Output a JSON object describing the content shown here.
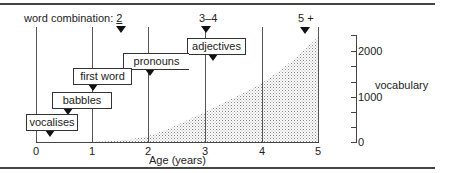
{
  "diagram": {
    "header": {
      "word_combination_label": "word combination: ",
      "word_combination_value": "2",
      "marker_3_4": "3–4",
      "marker_5_plus": "5 +"
    },
    "milestones": [
      {
        "label": "vocalises",
        "age": 0.25
      },
      {
        "label": "babbles",
        "age": 0.6
      },
      {
        "label": "first word",
        "age": 1.0
      },
      {
        "label": "pronouns",
        "age": 2.0
      },
      {
        "label": "adjectives",
        "age": 3.1
      }
    ],
    "x_axis": {
      "title": "Age (years)",
      "ticks": [
        "0",
        "1",
        "2",
        "3",
        "4",
        "5"
      ]
    },
    "y_axis": {
      "title": "vocabulary",
      "ticks": [
        "2000",
        "1000",
        "0"
      ]
    },
    "vocabulary_curve": {
      "ages": [
        1,
        2,
        3,
        4,
        5
      ],
      "words": [
        0,
        150,
        650,
        1300,
        2300
      ]
    },
    "colors": {
      "line": "#333333",
      "shading": "#9a9a9a"
    }
  }
}
